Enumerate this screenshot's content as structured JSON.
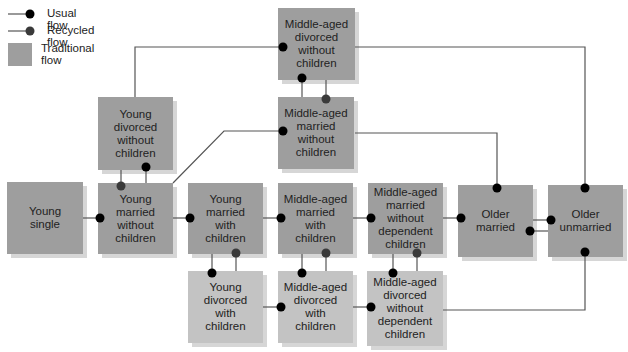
{
  "legend": {
    "usual_flow": "Usual flow",
    "recycled_flow": "Recycled flow",
    "traditional_flow": "Traditional\nflow"
  },
  "colors": {
    "traditional": "#9e9e9e",
    "non_traditional": "#c3c3c3",
    "usual_dot": "#000000",
    "recycled_dot": "#3a3a3a",
    "line": "#555555"
  },
  "nodes": {
    "young_single": "Young\nsingle",
    "young_married_no_children": "Young\nmarried\nwithout\nchildren",
    "young_divorced_no_children": "Young\ndivorced\nwithout\nchildren",
    "young_married_with_children": "Young\nmarried\nwith\nchildren",
    "young_divorced_with_children": "Young\ndivorced\nwith\nchildren",
    "middle_divorced_no_children": "Middle-aged\ndivorced\nwithout\nchildren",
    "middle_married_no_children": "Middle-aged\nmarried\nwithout\nchildren",
    "middle_married_with_children": "Middle-aged\nmarried\nwith\nchildren",
    "middle_divorced_with_children": "Middle-aged\ndivorced\nwith\nchildren",
    "middle_married_no_dependent": "Middle-aged\nmarried\nwithout\ndependent\nchildren",
    "middle_divorced_no_dependent": "Middle-aged\ndivorced\nwithout\ndependent\nchildren",
    "older_married": "Older\nmarried",
    "older_unmarried": "Older\nunmarried"
  }
}
